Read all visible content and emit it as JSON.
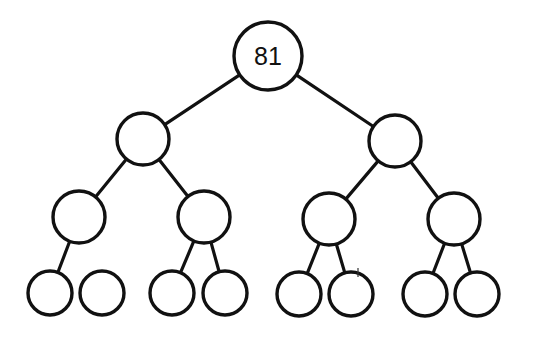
{
  "diagram": {
    "type": "binary-tree",
    "nodes": [
      {
        "id": "n0",
        "label": "81",
        "cx": 268,
        "cy": 56,
        "r": 34
      },
      {
        "id": "n1",
        "label": "",
        "cx": 143,
        "cy": 139,
        "r": 26
      },
      {
        "id": "n2",
        "label": "",
        "cx": 395,
        "cy": 141,
        "r": 26
      },
      {
        "id": "n3",
        "label": "",
        "cx": 79,
        "cy": 217,
        "r": 26
      },
      {
        "id": "n4",
        "label": "",
        "cx": 204,
        "cy": 217,
        "r": 26
      },
      {
        "id": "n5",
        "label": "",
        "cx": 329,
        "cy": 219,
        "r": 26
      },
      {
        "id": "n6",
        "label": "",
        "cx": 454,
        "cy": 219,
        "r": 26
      },
      {
        "id": "n7",
        "label": "",
        "cx": 50,
        "cy": 293,
        "r": 22
      },
      {
        "id": "n8",
        "label": "",
        "cx": 102,
        "cy": 293,
        "r": 22
      },
      {
        "id": "n9",
        "label": "",
        "cx": 172,
        "cy": 293,
        "r": 22
      },
      {
        "id": "n10",
        "label": "",
        "cx": 225,
        "cy": 293,
        "r": 22
      },
      {
        "id": "n11",
        "label": "",
        "cx": 299,
        "cy": 294,
        "r": 22
      },
      {
        "id": "n12",
        "label": "",
        "cx": 351,
        "cy": 294,
        "r": 22
      },
      {
        "id": "n13",
        "label": "",
        "cx": 425,
        "cy": 294,
        "r": 22
      },
      {
        "id": "n14",
        "label": "",
        "cx": 477,
        "cy": 294,
        "r": 22
      }
    ],
    "edges": [
      [
        "n0",
        "n1"
      ],
      [
        "n0",
        "n2"
      ],
      [
        "n1",
        "n3"
      ],
      [
        "n1",
        "n4"
      ],
      [
        "n2",
        "n5"
      ],
      [
        "n2",
        "n6"
      ],
      [
        "n3",
        "n7"
      ],
      [
        "n4",
        "n9"
      ],
      [
        "n4",
        "n10"
      ],
      [
        "n5",
        "n11"
      ],
      [
        "n5",
        "n12"
      ],
      [
        "n6",
        "n13"
      ],
      [
        "n6",
        "n14"
      ]
    ]
  }
}
